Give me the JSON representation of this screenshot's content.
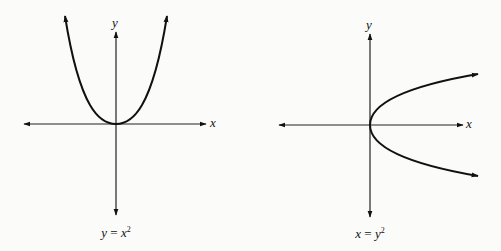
{
  "figure": {
    "panels": [
      {
        "id": "left",
        "equation": "y = x^2",
        "caption_lhs": "y",
        "caption_eq": " = ",
        "caption_rhs": "x",
        "caption_exp": "2",
        "x_label": "x",
        "y_label": "y",
        "curve": "upward-opening parabola with vertex at origin, arrows at both ends"
      },
      {
        "id": "right",
        "equation": "x = y^2",
        "caption_lhs": "x",
        "caption_eq": " = ",
        "caption_rhs": "y",
        "caption_exp": "2",
        "x_label": "x",
        "y_label": "y",
        "curve": "rightward-opening parabola with vertex at origin, arrows at both ends"
      }
    ]
  },
  "colors": {
    "background": "#fbfbfa",
    "ink": "#111111"
  }
}
